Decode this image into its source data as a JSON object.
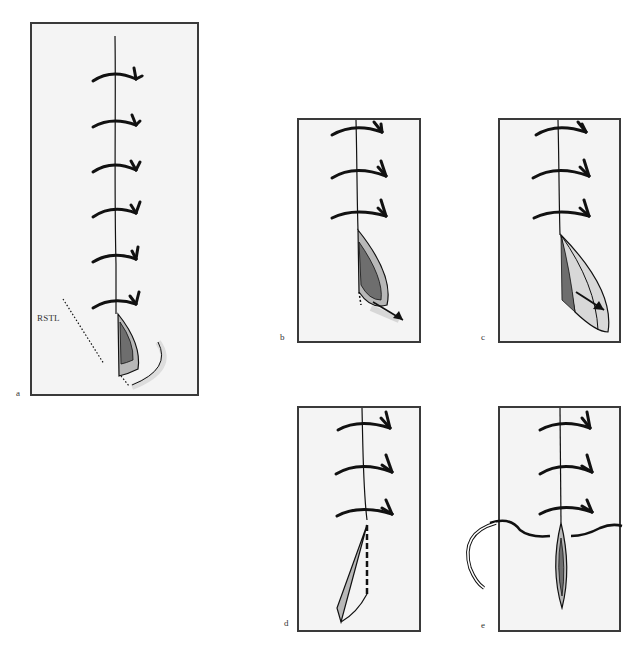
{
  "figure": {
    "panels": [
      {
        "id": "a",
        "label": "a",
        "sutures": 6,
        "annotation": "RSTL"
      },
      {
        "id": "b",
        "label": "b",
        "sutures": 3
      },
      {
        "id": "c",
        "label": "c",
        "sutures": 3
      },
      {
        "id": "d",
        "label": "d",
        "sutures": 3
      },
      {
        "id": "e",
        "label": "e",
        "sutures": 3
      }
    ],
    "colors": {
      "skin": "#f4f4f4",
      "border": "#3a3a3a",
      "ink": "#111111",
      "wound_outer": "#b8b8b8",
      "wound_inner": "#6e6e6e"
    }
  }
}
